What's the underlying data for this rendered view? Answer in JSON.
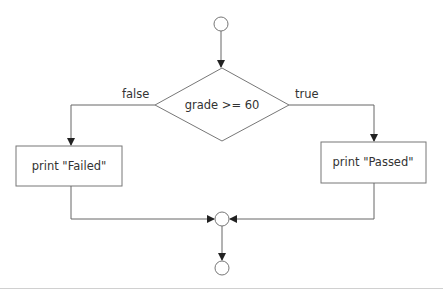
{
  "diagram": {
    "type": "flowchart",
    "nodes": {
      "start": {
        "shape": "circle"
      },
      "decision": {
        "shape": "diamond",
        "label": "grade >= 60"
      },
      "failed": {
        "shape": "rect",
        "label": "print \"Failed\""
      },
      "passed": {
        "shape": "rect",
        "label": "print \"Passed\""
      },
      "merge": {
        "shape": "circle"
      },
      "end": {
        "shape": "circle"
      }
    },
    "edges": {
      "false_label": "false",
      "true_label": "true"
    },
    "colors": {
      "stroke": "#777777",
      "text": "#333333",
      "arrowhead": "#222222"
    }
  }
}
